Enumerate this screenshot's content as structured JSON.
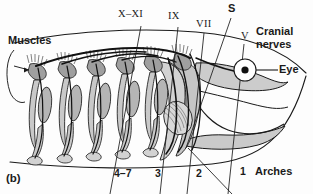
{
  "figure": {
    "panel_label": "(b)",
    "title_hidden": "",
    "background_color": "#fdfdfd",
    "ink_color": "#1a1a1a",
    "fill_gray": "#c9c9c9",
    "fill_gray_dark": "#ababab",
    "fill_gray_light": "#dddddd"
  },
  "labels": {
    "muscles": "Muscles",
    "cranial_nerves_line1": "Cranial",
    "cranial_nerves_line2": "nerves",
    "eye": "Eye",
    "arches": "Arches"
  },
  "cranial_nerves": [
    {
      "id": "nerve-x-xi",
      "label": "X–XI",
      "style": "roman",
      "x": 118,
      "y": 12
    },
    {
      "id": "nerve-ix",
      "label": "IX",
      "style": "roman",
      "x": 168,
      "y": 14
    },
    {
      "id": "nerve-vii",
      "label": "VII",
      "style": "roman",
      "x": 196,
      "y": 21
    },
    {
      "id": "nerve-s",
      "label": "S",
      "style": "sans",
      "x": 228,
      "y": 5
    },
    {
      "id": "nerve-v",
      "label": "V",
      "style": "roman",
      "x": 241,
      "y": 33
    }
  ],
  "arch_numbers": [
    {
      "id": "arch-4-7",
      "label": "4–7",
      "x": 114,
      "y": 171
    },
    {
      "id": "arch-3",
      "label": "3",
      "x": 155,
      "y": 171
    },
    {
      "id": "arch-2",
      "label": "2",
      "x": 196,
      "y": 171
    },
    {
      "id": "arch-1",
      "label": "1",
      "x": 240,
      "y": 169
    }
  ],
  "eye_marker": {
    "cx": 245,
    "cy": 70,
    "outer_r": 11,
    "pupil_r": 3.6
  }
}
